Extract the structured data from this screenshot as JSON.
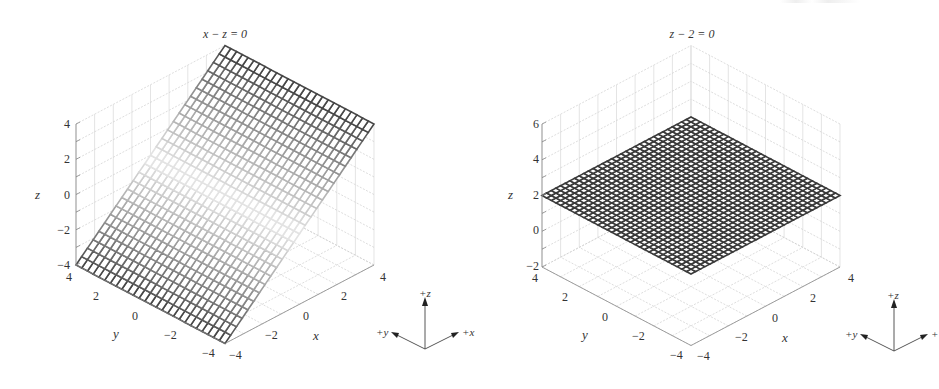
{
  "chart_data": [
    {
      "type": "surface3d",
      "title": "x − z = 0",
      "equation": "x - z = 0",
      "surface": "z = x",
      "xlabel": "x",
      "ylabel": "y",
      "zlabel": "z",
      "xlim": [
        -4,
        4
      ],
      "ylim": [
        -4,
        4
      ],
      "zlim": [
        -4,
        4
      ],
      "x_ticks": [
        -4,
        -2,
        0,
        2,
        4
      ],
      "y_ticks": [
        4,
        2,
        0,
        -2,
        -4
      ],
      "z_ticks": [
        4,
        2,
        0,
        -2,
        -4
      ],
      "x_tick_labels": [
        "−4",
        "−2",
        "0",
        "2",
        "4"
      ],
      "y_tick_labels": [
        "4",
        "2",
        "0",
        "−2",
        "−4"
      ],
      "z_tick_labels": [
        "4",
        "2",
        "0",
        "−2",
        "−4"
      ],
      "grid": true,
      "mesh_resolution": 26,
      "shading": "gray mesh, dark at |z| max, fading to light near z=0",
      "orientation_indicator": {
        "z": "+z",
        "y": "+y",
        "x": "+x"
      }
    },
    {
      "type": "surface3d",
      "title": "z − 2 = 0",
      "equation": "z - 2 = 0",
      "surface": "z = 2",
      "xlabel": "x",
      "ylabel": "y",
      "zlabel": "z",
      "xlim": [
        -4,
        4
      ],
      "ylim": [
        -4,
        4
      ],
      "zlim": [
        -2,
        6
      ],
      "x_ticks": [
        -4,
        -2,
        0,
        2,
        4
      ],
      "y_ticks": [
        4,
        2,
        0,
        -2,
        -4
      ],
      "z_ticks": [
        6,
        4,
        2,
        0,
        -2
      ],
      "x_tick_labels": [
        "−4",
        "−2",
        "0",
        "2",
        "4"
      ],
      "y_tick_labels": [
        "4",
        "2",
        "0",
        "−2",
        "−4"
      ],
      "z_tick_labels": [
        "6",
        "4",
        "2",
        "0",
        "−2"
      ],
      "grid": true,
      "mesh_resolution": 32,
      "shading": "uniform dark mesh",
      "orientation_indicator": {
        "z": "+z",
        "y": "+y",
        "x": "+"
      }
    }
  ],
  "plots": [
    {
      "title": "x − z = 0",
      "zlabel": "z",
      "ylabel": "y",
      "xlabel": "x",
      "z_ticks": [
        "4",
        "2",
        "0",
        "−2",
        "−4"
      ],
      "y_ticks": [
        "4",
        "2",
        "0",
        "−2",
        "−4"
      ],
      "x_ticks": [
        "−4",
        "−2",
        "0",
        "2",
        "4"
      ],
      "triad": {
        "z": "+z",
        "y": "+y",
        "x": "+x"
      }
    },
    {
      "title": "z − 2 = 0",
      "zlabel": "z",
      "ylabel": "y",
      "xlabel": "x",
      "z_ticks": [
        "6",
        "4",
        "2",
        "0",
        "−2"
      ],
      "y_ticks": [
        "4",
        "2",
        "0",
        "−2",
        "−4"
      ],
      "x_ticks": [
        "−4",
        "−2",
        "0",
        "2",
        "4"
      ],
      "triad": {
        "z": "+z",
        "y": "+y",
        "x": "+"
      }
    }
  ],
  "colors": {
    "mesh_dark": "#3a3a3a",
    "mesh_light": "#f2f2f2",
    "grid": "#cfcfcf",
    "axis": "#888888",
    "text": "#333333"
  }
}
